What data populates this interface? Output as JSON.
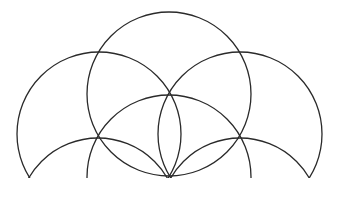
{
  "diagram": {
    "stroke_color": "#2a2a2a",
    "background": "#ffffff",
    "clip_baseline_y": 178,
    "circles": [
      {
        "id": "top-center",
        "cx": 169,
        "cy": 94,
        "r": 82
      },
      {
        "id": "upper-left",
        "cx": 99,
        "cy": 134,
        "r": 82
      },
      {
        "id": "upper-right",
        "cx": 240,
        "cy": 134,
        "r": 82
      },
      {
        "id": "middle-center",
        "cx": 169,
        "cy": 177,
        "r": 82
      },
      {
        "id": "lower-left",
        "cx": 98,
        "cy": 218,
        "r": 80
      },
      {
        "id": "lower-right",
        "cx": 240,
        "cy": 218,
        "r": 80
      }
    ]
  }
}
